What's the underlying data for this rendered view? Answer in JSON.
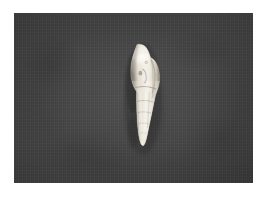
{
  "image": {
    "kind": "natural-photograph",
    "subject": "fusiform gastropod shell specimen",
    "orientation": "vertical, apex down, aperture side facing viewer",
    "alt_text": "A pale cream-white spindle-shaped sea snail shell photographed against a dark grey textured backdrop",
    "canvas": {
      "width": 267,
      "height": 197
    },
    "margin": {
      "color": "#ffffff",
      "left": 14,
      "top": 13,
      "right": 14,
      "bottom": 14
    }
  },
  "photo": {
    "plate": {
      "x": 14,
      "y": 13,
      "width": 239,
      "height": 170,
      "background_color": "#434343",
      "texture": "fine vertical weave / scan lines with mottled tonal variation",
      "vignette": "darker toward left, right and bottom edges"
    }
  },
  "subject": {
    "label": "shell",
    "bounding_box": {
      "x": 126,
      "y": 44,
      "width": 25,
      "height": 101
    },
    "body_whorl": {
      "label": "body whorl",
      "description": "large bulbous upper chamber with a rounded shoulder and a smooth glossy surface"
    },
    "aperture": {
      "label": "aperture",
      "description": "narrow elongated opening along the right flank of the body whorl"
    },
    "spire": {
      "label": "spire",
      "description": "tapering lower portion formed by four to five stepped whorls"
    },
    "apex": {
      "label": "apex",
      "description": "pointed tip at the bottom of the spire"
    },
    "sutures": {
      "label": "sutures",
      "count": 5,
      "description": "faint incised lines separating successive whorls"
    },
    "colors": {
      "highlight": "#f4f1e9",
      "midtone": "#d8d3c7",
      "shade": "#a39c90",
      "deep_shadow": "#6f6a61"
    },
    "lighting": "diffuse key light from the upper left, shadow falling on the left flank"
  }
}
